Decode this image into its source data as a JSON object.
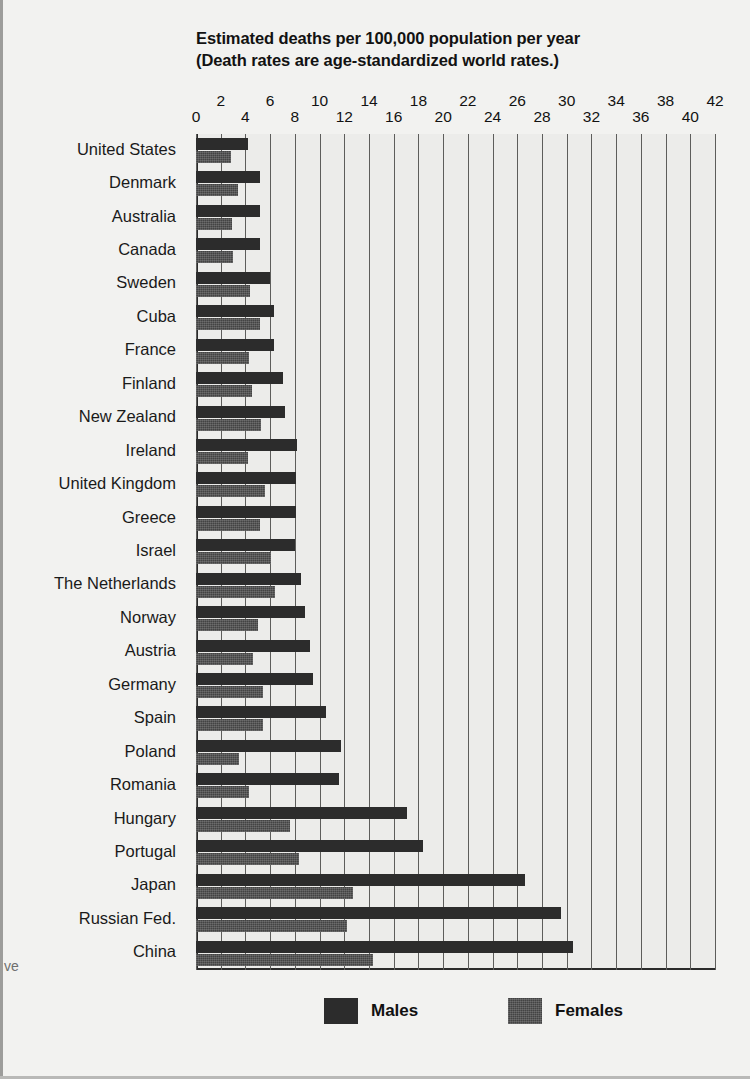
{
  "title": {
    "line1": "Estimated deaths per 100,000 population per year",
    "line2": "(Death rates are age-standardized world rates.)"
  },
  "margin_fragment": "ve",
  "legend": {
    "males_label": "Males",
    "females_label": "Females",
    "male_color": "#2c2c2c",
    "female_color": "#434343"
  },
  "axis": {
    "ticks": [
      0,
      2,
      4,
      6,
      8,
      10,
      12,
      14,
      16,
      18,
      20,
      22,
      24,
      26,
      28,
      30,
      32,
      34,
      36,
      38,
      40,
      42
    ],
    "min": 0,
    "max": 42,
    "step": 2
  },
  "chart_data": {
    "type": "bar",
    "orientation": "horizontal",
    "title": "Estimated deaths per 100,000 population per year (Death rates are age-standardized world rates.)",
    "xlabel": "",
    "ylabel": "",
    "xlim": [
      0,
      42
    ],
    "grid": true,
    "legend_position": "bottom",
    "categories": [
      "United States",
      "Denmark",
      "Australia",
      "Canada",
      "Sweden",
      "Cuba",
      "France",
      "Finland",
      "New Zealand",
      "Ireland",
      "United Kingdom",
      "Greece",
      "Israel",
      "The Netherlands",
      "Norway",
      "Austria",
      "Germany",
      "Spain",
      "Poland",
      "Romania",
      "Hungary",
      "Portugal",
      "Japan",
      "Russian Fed.",
      "China"
    ],
    "series": [
      {
        "name": "Males",
        "values": [
          4.2,
          5.2,
          5.2,
          5.2,
          6.0,
          6.3,
          6.3,
          7.0,
          7.2,
          8.2,
          8.1,
          8.1,
          8.0,
          8.5,
          8.8,
          9.2,
          9.5,
          10.5,
          11.7,
          11.6,
          17.1,
          18.4,
          26.6,
          29.5,
          30.5
        ],
        "color": "#2c2c2c"
      },
      {
        "name": "Females",
        "values": [
          2.8,
          3.4,
          2.9,
          3.0,
          4.4,
          5.2,
          4.3,
          4.5,
          5.3,
          4.2,
          5.6,
          5.2,
          6.1,
          6.4,
          5.0,
          4.6,
          5.4,
          5.4,
          3.5,
          4.3,
          7.6,
          8.3,
          12.7,
          12.2,
          14.3
        ],
        "color": "#434343"
      }
    ]
  }
}
